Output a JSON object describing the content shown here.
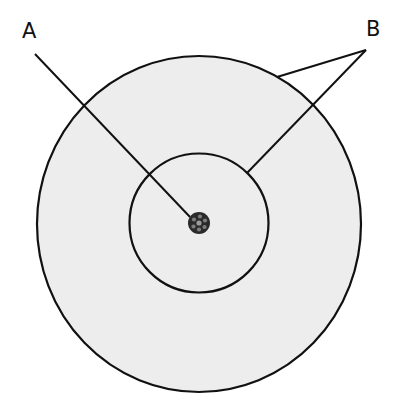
{
  "diagram": {
    "labels": {
      "a": "A",
      "b": "B"
    },
    "colors": {
      "outer_fill": "#ededed",
      "stroke": "#111111",
      "nucleus_fill": "#2a2a2a",
      "nucleus_spots": "#8a8a8a",
      "background": "#ffffff"
    }
  }
}
